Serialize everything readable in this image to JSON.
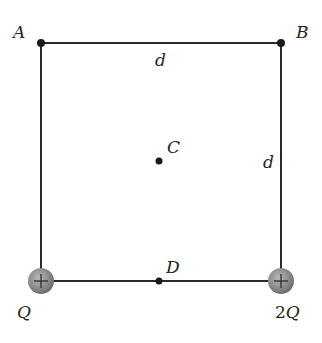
{
  "diagram": {
    "colors": {
      "line": "#2a2a2a",
      "point": "#1a1a1a",
      "charge_fill": "#8a8a8a",
      "charge_edge": "#6e6e6e",
      "label": "#222222"
    },
    "points": {
      "A": {
        "label": "A"
      },
      "B": {
        "label": "B"
      },
      "C": {
        "label": "C"
      },
      "D": {
        "label": "D"
      }
    },
    "sides": {
      "top": {
        "label": "d"
      },
      "right": {
        "label": "d"
      }
    },
    "charges": [
      {
        "position": "bottom-left",
        "label": "Q",
        "sign": "+"
      },
      {
        "position": "bottom-right",
        "label_coef": "2",
        "label_var": "Q",
        "sign": "+"
      }
    ]
  }
}
